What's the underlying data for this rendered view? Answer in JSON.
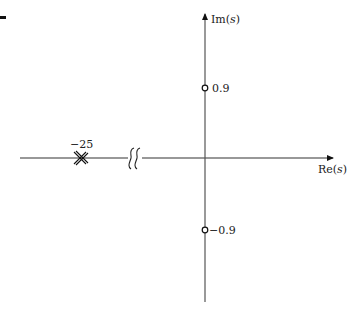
{
  "diagram": {
    "type": "pole-zero-plot",
    "axes": {
      "real_label_prefix": "Re(",
      "real_label_var": "s",
      "real_label_suffix": ")",
      "imag_label_prefix": "Im(",
      "imag_label_var": "s",
      "imag_label_suffix": ")"
    },
    "poles": [
      {
        "label": "−25",
        "re": -25,
        "im": 0,
        "marker": "double-cross"
      }
    ],
    "zeros": [
      {
        "label": "0.9",
        "re": 0,
        "im": 0.9,
        "marker": "circle"
      },
      {
        "label": "−0.9",
        "re": 0,
        "im": -0.9,
        "marker": "circle"
      }
    ],
    "axis_break": {
      "axis": "real",
      "symbol": "double-s"
    },
    "colors": {
      "ink": "#111111",
      "background": "#ffffff"
    }
  }
}
